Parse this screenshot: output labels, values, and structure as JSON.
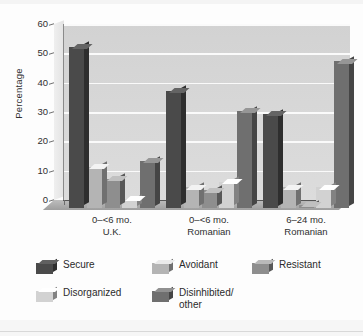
{
  "chart_data": {
    "type": "bar",
    "title": "",
    "subtitle": "",
    "xlabel": "",
    "ylabel": "Percentage",
    "ylim": [
      0,
      60
    ],
    "yticks": [
      0,
      10,
      20,
      30,
      40,
      50,
      60
    ],
    "grid": true,
    "legend_position": "bottom",
    "categories": [
      "0–<6 mo.\nU.K.",
      "0–<6 mo.\nRomanian",
      "6–24 mo.\nRomanian"
    ],
    "category_lines": [
      [
        "0–<6 mo.",
        "U.K."
      ],
      [
        "0–<6 mo.",
        "Romanian"
      ],
      [
        "6–24 mo.",
        "Romanian"
      ]
    ],
    "series": [
      {
        "name": "Secure",
        "color": "#4a4a4a",
        "values": [
          55,
          40,
          32
        ]
      },
      {
        "name": "Avoidant",
        "color": "#b4b4b4",
        "values": [
          14,
          7,
          7
        ]
      },
      {
        "name": "Resistant",
        "color": "#8e8e8e",
        "values": [
          10,
          6,
          1
        ]
      },
      {
        "name": "Disorganized",
        "color": "#d2d2d2",
        "values": [
          3,
          9,
          7
        ]
      },
      {
        "name": "Disinhibited/\nother",
        "color": "#6f6f6f",
        "values": [
          16,
          33,
          50
        ]
      }
    ]
  },
  "legend": {
    "items": [
      {
        "label": "Secure"
      },
      {
        "label": "Avoidant"
      },
      {
        "label": "Resistant"
      },
      {
        "label": "Disorganized"
      },
      {
        "label": "Disinhibited/\nother"
      }
    ]
  },
  "axis": {
    "y_title": "Percentage",
    "tick_60": "60",
    "tick_50": "50",
    "tick_40": "40",
    "tick_30": "30",
    "tick_20": "20",
    "tick_10": "10",
    "tick_0": "0"
  },
  "xcats": {
    "g1_line1": "0–<6 mo.",
    "g1_line2": "U.K.",
    "g2_line1": "0–<6 mo.",
    "g2_line2": "Romanian",
    "g3_line1": "6–24 mo.",
    "g3_line2": "Romanian"
  },
  "colors": {
    "secure": "#4a4a4a",
    "avoidant": "#b4b4b4",
    "resistant": "#8e8e8e",
    "disorganized": "#d2d2d2",
    "disinhibited": "#6f6f6f",
    "panel": "#d7d7d7",
    "gridline": "#fafafa",
    "floor": "#a8a8a8"
  }
}
